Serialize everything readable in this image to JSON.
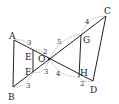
{
  "diagram": {
    "points": {
      "A": {
        "label": "A",
        "x": 14,
        "y": 40
      },
      "B": {
        "label": "B",
        "x": 13,
        "y": 87
      },
      "C": {
        "label": "C",
        "x": 106,
        "y": 16
      },
      "D": {
        "label": "D",
        "x": 93,
        "y": 81
      },
      "O": {
        "label": "O",
        "x": 49,
        "y": 59
      },
      "E": {
        "label": "E",
        "x": 33,
        "y": 52
      },
      "F": {
        "label": "F",
        "x": 33,
        "y": 70
      },
      "G": {
        "label": "G",
        "x": 82,
        "y": 35
      },
      "H": {
        "label": "H",
        "x": 79,
        "y": 77
      }
    },
    "lengths": {
      "AE": "3",
      "EO": "2",
      "OG": "5",
      "GC": "4",
      "BF": "3",
      "FO": "3",
      "OH": "4",
      "HD": "2"
    }
  }
}
